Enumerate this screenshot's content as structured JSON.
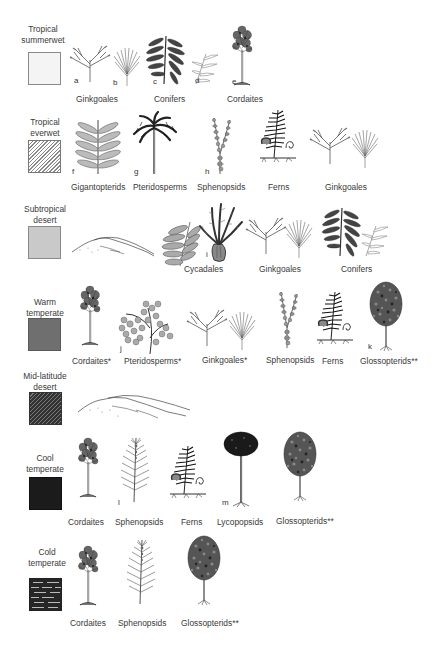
{
  "figure": {
    "type": "paleoclimate-biome-flora-diagram",
    "biomes": [
      {
        "id": "tropical-summerwet",
        "label_lines": [
          "Tropical",
          "summerwet"
        ],
        "swatch": {
          "pattern": "solid",
          "color": "#f4f4f4"
        },
        "taxa": [
          {
            "name": "Ginkgoales",
            "letters": [
              "a",
              "b"
            ]
          },
          {
            "name": "Conifers",
            "letters": [
              "c",
              "d"
            ]
          },
          {
            "name": "Cordaites",
            "letters": [
              "e"
            ]
          }
        ]
      },
      {
        "id": "tropical-everwet",
        "label_lines": [
          "Tropical",
          "everwet"
        ],
        "swatch": {
          "pattern": "diagonal-hatch",
          "color": "#8a8a8a"
        },
        "taxa": [
          {
            "name": "Gigantopterids",
            "letters": [
              "f"
            ]
          },
          {
            "name": "Pteridosperms",
            "letters": [
              "g"
            ]
          },
          {
            "name": "Sphenopsids",
            "letters": [
              "h"
            ]
          },
          {
            "name": "Ferns",
            "letters": []
          },
          {
            "name": "Ginkgoales",
            "letters": []
          }
        ]
      },
      {
        "id": "subtropical-desert",
        "label_lines": [
          "Subtropical",
          "desert"
        ],
        "swatch": {
          "pattern": "solid",
          "color": "#c9c9c9"
        },
        "illustration": "sand-dunes",
        "taxa": [
          {
            "name": "Cycadales",
            "letters": [
              "i"
            ]
          },
          {
            "name": "Ginkgoales",
            "letters": []
          },
          {
            "name": "Conifers",
            "letters": []
          }
        ]
      },
      {
        "id": "warm-temperate",
        "label_lines": [
          "Warm",
          "temperate"
        ],
        "swatch": {
          "pattern": "solid",
          "color": "#6f6f6f"
        },
        "taxa": [
          {
            "name": "Cordaites*",
            "letters": []
          },
          {
            "name": "Pteridosperms*",
            "letters": [
              "j"
            ]
          },
          {
            "name": "Ginkgoales*",
            "letters": []
          },
          {
            "name": "Sphenopsids",
            "letters": []
          },
          {
            "name": "Ferns",
            "letters": []
          },
          {
            "name": "Glossopterids**",
            "letters": [
              "k"
            ]
          }
        ]
      },
      {
        "id": "mid-latitude-desert",
        "label_lines": [
          "Mid-latitude",
          "desert"
        ],
        "swatch": {
          "pattern": "dark-diagonal-hatch",
          "color": "#333333"
        },
        "illustration": "sand-dunes",
        "taxa": []
      },
      {
        "id": "cool-temperate",
        "label_lines": [
          "Cool",
          "temperate"
        ],
        "swatch": {
          "pattern": "solid",
          "color": "#1b1b1b"
        },
        "taxa": [
          {
            "name": "Cordaites",
            "letters": []
          },
          {
            "name": "Sphenopsids",
            "letters": [
              "l"
            ]
          },
          {
            "name": "Ferns",
            "letters": []
          },
          {
            "name": "Lycopopsids",
            "letters": [
              "m"
            ]
          },
          {
            "name": "Glossopterids**",
            "letters": []
          }
        ]
      },
      {
        "id": "cold-temperate",
        "label_lines": [
          "Cold",
          "temperate"
        ],
        "swatch": {
          "pattern": "dark-with-light-dashes",
          "color": "#262626"
        },
        "taxa": [
          {
            "name": "Cordaites",
            "letters": []
          },
          {
            "name": "Sphenopsids",
            "letters": []
          },
          {
            "name": "Glossopterids**",
            "letters": []
          }
        ]
      }
    ]
  },
  "labels": {
    "tsw_1": "Tropical",
    "tsw_2": "summerwet",
    "tew_1": "Tropical",
    "tew_2": "everwet",
    "sd_1": "Subtropical",
    "sd_2": "desert",
    "wt_1": "Warm",
    "wt_2": "temperate",
    "mld_1": "Mid-latitude",
    "mld_2": "desert",
    "ct_1": "Cool",
    "ct_2": "temperate",
    "cold_1": "Cold",
    "cold_2": "temperate"
  },
  "taxa": {
    "r1": [
      "Ginkgoales",
      "Conifers",
      "Cordaites"
    ],
    "r2": [
      "Gigantopterids",
      "Pteridosperms",
      "Sphenopsids",
      "Ferns",
      "Ginkgoales"
    ],
    "r3": [
      "Cycadales",
      "Ginkgoales",
      "Conifers"
    ],
    "r4": [
      "Cordaites*",
      "Pteridosperms*",
      "Ginkgoales*",
      "Sphenopsids",
      "Ferns",
      "Glossopterids**"
    ],
    "r6": [
      "Cordaites",
      "Sphenopsids",
      "Ferns",
      "Lycopopsids",
      "Glossopterids**"
    ],
    "r7": [
      "Cordaites",
      "Sphenopsids",
      "Glossopterids**"
    ]
  },
  "letters": {
    "a": "a",
    "b": "b",
    "c": "c",
    "d": "d",
    "e": "e",
    "f": "f",
    "g": "g",
    "h": "h",
    "i": "i",
    "j": "j",
    "k": "k",
    "l": "l",
    "m": "m"
  }
}
